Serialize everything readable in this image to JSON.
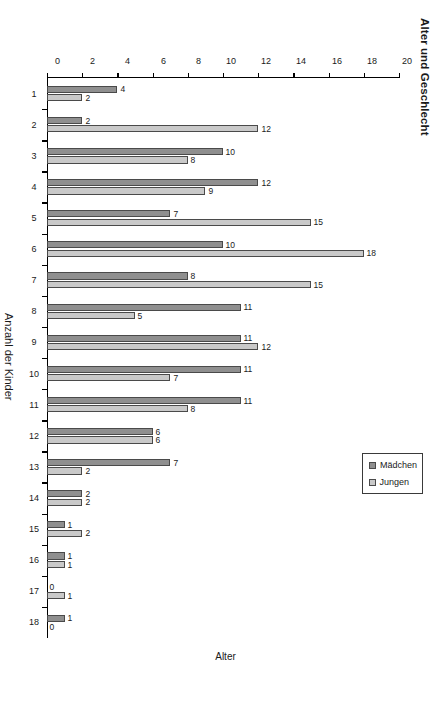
{
  "chart_data": {
    "type": "bar",
    "title": "Alter und Geschlecht",
    "xlabel": "Alter",
    "ylabel": "Anzahl der Kinder",
    "orientation": "horizontal-rotated",
    "grid": false,
    "legend_position": "top-right",
    "ylim": [
      0,
      20
    ],
    "ytick_labels": [
      "0",
      "2",
      "4",
      "6",
      "8",
      "10",
      "12",
      "14",
      "16",
      "18",
      "20"
    ],
    "ytick_values": [
      0,
      2,
      4,
      6,
      8,
      10,
      12,
      14,
      16,
      18,
      20
    ],
    "categories": [
      "1",
      "2",
      "3",
      "4",
      "5",
      "6",
      "7",
      "8",
      "9",
      "10",
      "11",
      "12",
      "13",
      "14",
      "15",
      "16",
      "17",
      "18"
    ],
    "series": [
      {
        "name": "Jungen",
        "color": "#c9c9c9",
        "values": [
          2,
          12,
          8,
          9,
          15,
          18,
          15,
          5,
          12,
          7,
          8,
          6,
          2,
          2,
          2,
          1,
          1,
          0
        ],
        "labels": [
          "2",
          "12",
          "8",
          "9",
          "15",
          "18",
          "15",
          "5",
          "12",
          "7",
          "8",
          "6",
          "2",
          "2",
          "2",
          "1",
          "1",
          "0"
        ]
      },
      {
        "name": "Mädchen",
        "color": "#8f8f8f",
        "values": [
          4,
          2,
          10,
          12,
          7,
          10,
          8,
          11,
          11,
          11,
          11,
          6,
          7,
          2,
          1,
          1,
          0,
          1
        ],
        "labels": [
          "4",
          "2",
          "10",
          "12",
          "7",
          "10",
          "8",
          "11",
          "11",
          "11",
          "11",
          "6",
          "7",
          "2",
          "1",
          "1",
          "0",
          "1"
        ]
      }
    ]
  },
  "legend": {
    "items": [
      {
        "label": "Jungen",
        "swatch": "jungen"
      },
      {
        "label": "Mädchen",
        "swatch": "maedchen"
      }
    ]
  }
}
